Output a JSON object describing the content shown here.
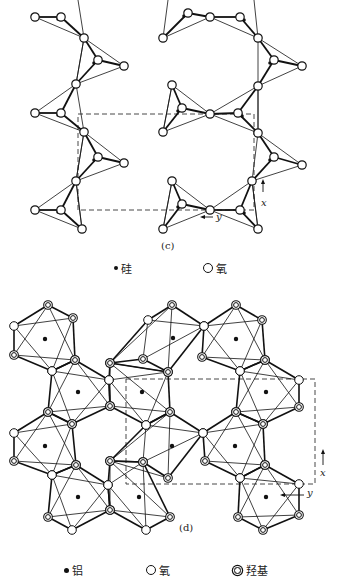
{
  "panel_c": {
    "caption": "(c)",
    "legend": [
      {
        "symbol": "filled-dot",
        "label": "硅"
      },
      {
        "symbol": "open-circle",
        "label": "氧"
      }
    ],
    "axes": {
      "x": "x",
      "y": "y"
    },
    "unit_cell": {
      "x": 78,
      "y": 114,
      "w": 176,
      "h": 96
    },
    "basal_oxygen": [
      [
        35,
        17
      ],
      [
        84,
        38
      ],
      [
        124,
        66
      ],
      [
        76,
        84
      ],
      [
        35,
        113
      ],
      [
        84,
        132
      ],
      [
        76,
        181
      ],
      [
        35,
        210
      ],
      [
        82,
        229
      ],
      [
        163,
        38
      ],
      [
        210,
        17
      ],
      [
        172,
        85
      ],
      [
        163,
        132
      ],
      [
        172,
        181
      ],
      [
        163,
        229
      ],
      [
        210,
        210
      ],
      [
        258,
        38
      ],
      [
        258,
        86
      ],
      [
        302,
        66
      ],
      [
        258,
        133
      ],
      [
        252,
        181
      ],
      [
        302,
        165
      ],
      [
        258,
        229
      ]
    ],
    "tetrahedra": [
      {
        "apex": [
          61,
          17
        ],
        "si": [
          58,
          19
        ],
        "corners": [
          [
            35,
            17
          ],
          [
            84,
            38
          ]
        ]
      },
      {
        "apex": [
          98,
          60
        ],
        "si": [
          94,
          63
        ],
        "corners": [
          [
            84,
            38
          ],
          [
            124,
            66
          ],
          [
            76,
            84
          ]
        ]
      },
      {
        "apex": [
          61,
          113
        ],
        "si": [
          58,
          115
        ],
        "corners": [
          [
            35,
            113
          ],
          [
            76,
            84
          ],
          [
            84,
            132
          ]
        ]
      },
      {
        "apex": [
          98,
          157
        ],
        "si": [
          94,
          160
        ],
        "corners": [
          [
            84,
            132
          ],
          [
            124,
            163
          ],
          [
            76,
            181
          ]
        ]
      },
      {
        "apex": [
          61,
          210
        ],
        "si": [
          58,
          212
        ],
        "corners": [
          [
            35,
            210
          ],
          [
            76,
            181
          ],
          [
            82,
            229
          ]
        ]
      },
      {
        "apex": [
          188,
          13
        ],
        "si": [
          184,
          16
        ],
        "corners": [
          [
            163,
            38
          ],
          [
            210,
            17
          ]
        ]
      },
      {
        "apex": [
          240,
          17
        ],
        "si": [
          244,
          20
        ],
        "corners": [
          [
            210,
            17
          ],
          [
            258,
            38
          ]
        ]
      },
      {
        "apex": [
          182,
          108
        ],
        "si": [
          178,
          111
        ],
        "corners": [
          [
            163,
            132
          ],
          [
            172,
            85
          ],
          [
            210,
            114
          ]
        ]
      },
      {
        "apex": [
          238,
          113
        ],
        "si": [
          242,
          116
        ],
        "corners": [
          [
            210,
            114
          ],
          [
            258,
            133
          ],
          [
            258,
            86
          ]
        ]
      },
      {
        "apex": [
          182,
          204
        ],
        "si": [
          178,
          207
        ],
        "corners": [
          [
            163,
            229
          ],
          [
            172,
            181
          ],
          [
            210,
            210
          ]
        ]
      },
      {
        "apex": [
          240,
          210
        ],
        "si": [
          244,
          213
        ],
        "corners": [
          [
            210,
            210
          ],
          [
            258,
            229
          ],
          [
            252,
            181
          ]
        ]
      },
      {
        "apex": [
          274,
          60
        ],
        "si": [
          270,
          63
        ],
        "corners": [
          [
            258,
            38
          ],
          [
            302,
            66
          ],
          [
            258,
            86
          ]
        ]
      },
      {
        "apex": [
          274,
          157
        ],
        "si": [
          270,
          160
        ],
        "corners": [
          [
            258,
            133
          ],
          [
            302,
            165
          ],
          [
            252,
            181
          ]
        ]
      }
    ],
    "extra_oxygen": [
      [
        124,
        163
      ],
      [
        210,
        114
      ]
    ]
  },
  "panel_d": {
    "caption": "(d)",
    "legend": [
      {
        "symbol": "filled-dot",
        "label": "铝"
      },
      {
        "symbol": "open-circle",
        "label": "氧"
      },
      {
        "symbol": "double-circle",
        "label": "羟基"
      }
    ],
    "axes": {
      "x": "x",
      "y": "y"
    },
    "unit_cell": {
      "x": 126,
      "y": 379,
      "w": 189,
      "h": 105
    },
    "octahedra": [
      {
        "al": [
          45,
          339
        ],
        "o": [
          [
            14,
            326
          ],
          [
            52,
            371
          ]
        ],
        "oh": [
          [
            48,
            305
          ],
          [
            73,
            318
          ],
          [
            14,
            355
          ],
          [
            75,
            360
          ]
        ]
      },
      {
        "al": [
          173,
          338
        ],
        "o": [
          [
            148,
            320
          ],
          [
            204,
            326
          ]
        ],
        "oh": [
          [
            172,
            305
          ],
          [
            143,
            359
          ],
          [
            168,
            372
          ],
          [
            110,
            363
          ]
        ]
      },
      {
        "al": [
          236,
          339
        ],
        "o": [
          [
            204,
            326
          ],
          [
            240,
            371
          ]
        ],
        "oh": [
          [
            236,
            305
          ],
          [
            262,
            320
          ],
          [
            202,
            357
          ],
          [
            265,
            360
          ]
        ]
      },
      {
        "al": [
          78,
          392
        ],
        "o": [
          [
            52,
            371
          ],
          [
            109,
            380
          ]
        ],
        "oh": [
          [
            75,
            360
          ],
          [
            48,
            412
          ],
          [
            110,
            406
          ],
          [
            72,
            424
          ]
        ]
      },
      {
        "al": [
          142,
          392
        ],
        "o": [
          [
            109,
            380
          ],
          [
            146,
            425
          ]
        ],
        "oh": [
          [
            110,
            363
          ],
          [
            168,
            372
          ],
          [
            110,
            406
          ],
          [
            170,
            412
          ]
        ]
      },
      {
        "al": [
          266,
          392
        ],
        "o": [
          [
            240,
            371
          ],
          [
            299,
            380
          ]
        ],
        "oh": [
          [
            265,
            360
          ],
          [
            299,
            407
          ],
          [
            236,
            412
          ],
          [
            263,
            424
          ]
        ]
      },
      {
        "al": [
          45,
          446
        ],
        "o": [
          [
            14,
            433
          ],
          [
            52,
            475
          ]
        ],
        "oh": [
          [
            48,
            412
          ],
          [
            72,
            424
          ],
          [
            14,
            461
          ],
          [
            76,
            465
          ]
        ]
      },
      {
        "al": [
          172,
          446
        ],
        "o": [
          [
            146,
            425
          ],
          [
            203,
            433
          ]
        ],
        "oh": [
          [
            170,
            412
          ],
          [
            143,
            462
          ],
          [
            168,
            478
          ],
          [
            110,
            461
          ]
        ]
      },
      {
        "al": [
          235,
          446
        ],
        "o": [
          [
            203,
            433
          ],
          [
            240,
            478
          ]
        ],
        "oh": [
          [
            236,
            412
          ],
          [
            263,
            424
          ],
          [
            205,
            461
          ],
          [
            265,
            465
          ]
        ]
      },
      {
        "al": [
          78,
          497
        ],
        "o": [
          [
            52,
            475
          ],
          [
            108,
            485
          ],
          [
            72,
            530
          ]
        ],
        "oh": [
          [
            76,
            465
          ],
          [
            48,
            517
          ],
          [
            110,
            510
          ]
        ]
      },
      {
        "al": [
          139,
          497
        ],
        "o": [
          [
            108,
            485
          ],
          [
            146,
            530
          ]
        ],
        "oh": [
          [
            110,
            461
          ],
          [
            143,
            462
          ],
          [
            110,
            510
          ],
          [
            170,
            517
          ]
        ]
      },
      {
        "al": [
          266,
          497
        ],
        "o": [
          [
            240,
            478
          ],
          [
            299,
            484
          ]
        ],
        "oh": [
          [
            265,
            465
          ],
          [
            238,
            517
          ],
          [
            299,
            515
          ],
          [
            263,
            530
          ]
        ]
      }
    ]
  }
}
